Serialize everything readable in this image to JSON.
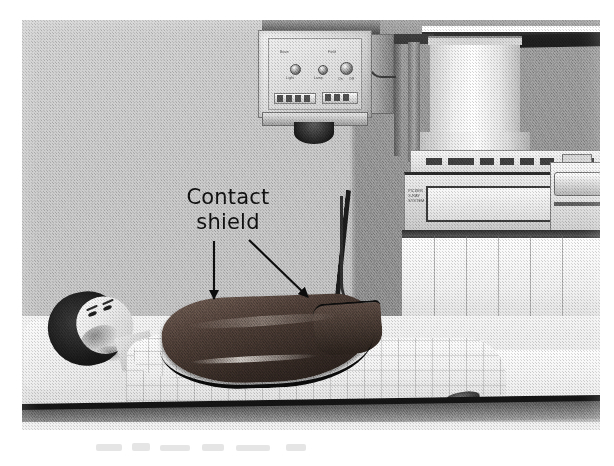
{
  "figure": {
    "type": "photograph",
    "setting": "X-ray radiography room",
    "print_style": "halftone black-and-white photographic plate",
    "background_color": "#ffffff",
    "plate": {
      "left": 22,
      "top": 20,
      "width": 578,
      "height": 410
    }
  },
  "annotation": {
    "label_line1": "Contact",
    "label_line2": "shield",
    "text_color": "#111111",
    "arrows": [
      {
        "name": "vertical-arrow",
        "direction": "down",
        "from_x": 214,
        "from_y": 242,
        "to_x": 214,
        "to_y": 300,
        "points_to": "contact shield (front edge)"
      },
      {
        "name": "diagonal-arrow",
        "direction": "down-right",
        "from_x": 248,
        "from_y": 240,
        "to_x": 308,
        "to_y": 298,
        "points_to": "contact shield (far edge)"
      }
    ]
  },
  "scene_elements": {
    "wall_left_color": "#c9c9c9",
    "wall_right_color": "#949494",
    "ceiling_rail_color": "#1e1e1e",
    "tube_column_color": "#f2f2f2",
    "shield_color": "#3b2f29",
    "shield_edge_color": "#0a0a0a",
    "table_surface_color": "#ececec",
    "table_edge_color": "#141414",
    "gown_color": "#f1f1f1",
    "hair_color": "#171717"
  },
  "equipment": {
    "collimator": {
      "name": "collimator-head",
      "body_color": "#e3e3e3",
      "knob_count": 3,
      "control_labels": [
        "Beam",
        "Field",
        "Light",
        "Lamp",
        "On",
        "Off"
      ]
    },
    "console": {
      "name": "image-intensifier-console",
      "brand_lines": [
        "PICKER",
        "X-RAY",
        "SYSTEM"
      ],
      "button_count": 7,
      "screen_color": "#fafafa"
    },
    "tube_support": {
      "name": "tube-column",
      "shape": "cylindrical",
      "color": "#ffffff"
    },
    "cable": {
      "name": "high-tension-cable",
      "color": "#1c1c1c"
    },
    "drape": {
      "name": "pleated-drape",
      "fold_count": 6,
      "color": "#f0f0f0"
    }
  },
  "patient": {
    "position": "supine",
    "garment": "checkered hospital gown",
    "shield_placement": "over pelvis / gonadal region"
  }
}
